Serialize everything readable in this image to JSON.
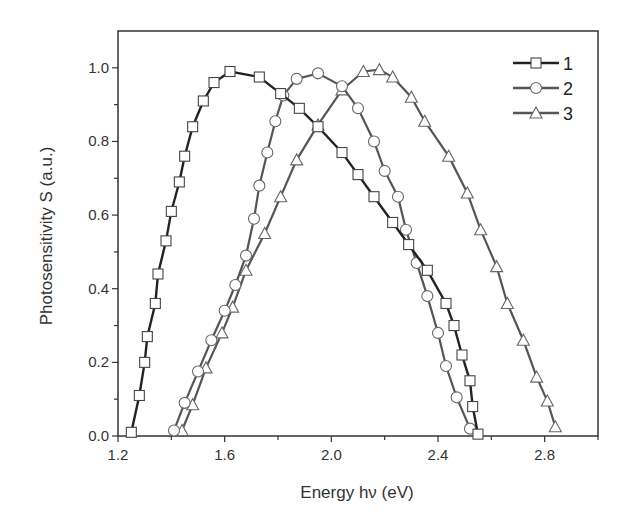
{
  "chart_data": {
    "type": "line",
    "title": "",
    "xlabel": "Energy hν (eV)",
    "ylabel": "Photosensitivity S (a.u.)",
    "xlim": [
      1.2,
      3.0
    ],
    "ylim": [
      0.0,
      1.1
    ],
    "xticks": [
      1.2,
      1.6,
      2.0,
      2.4,
      2.8
    ],
    "xtick_labels": [
      "1.2",
      "1.6",
      "2.0",
      "2.4",
      "2.8"
    ],
    "yticks": [
      0.0,
      0.2,
      0.4,
      0.6,
      0.8,
      1.0
    ],
    "ytick_labels": [
      "0.0",
      "0.2",
      "0.4",
      "0.6",
      "0.8",
      "1.0"
    ],
    "grid": false,
    "legend_position": "upper right",
    "series": [
      {
        "name": "1",
        "marker": "square",
        "color": "#222222",
        "x": [
          1.25,
          1.28,
          1.3,
          1.31,
          1.34,
          1.35,
          1.38,
          1.4,
          1.43,
          1.45,
          1.48,
          1.52,
          1.56,
          1.62,
          1.73,
          1.81,
          1.88,
          1.95,
          2.04,
          2.1,
          2.16,
          2.23,
          2.29,
          2.36,
          2.43,
          2.46,
          2.49,
          2.52,
          2.53,
          2.55
        ],
        "values": [
          0.01,
          0.11,
          0.2,
          0.27,
          0.36,
          0.44,
          0.53,
          0.61,
          0.69,
          0.76,
          0.84,
          0.91,
          0.96,
          0.99,
          0.975,
          0.93,
          0.89,
          0.84,
          0.77,
          0.71,
          0.65,
          0.58,
          0.52,
          0.45,
          0.36,
          0.3,
          0.22,
          0.15,
          0.08,
          0.005
        ]
      },
      {
        "name": "2",
        "marker": "circle",
        "color": "#555555",
        "x": [
          1.41,
          1.45,
          1.5,
          1.55,
          1.6,
          1.64,
          1.68,
          1.71,
          1.73,
          1.76,
          1.79,
          1.82,
          1.87,
          1.95,
          2.04,
          2.1,
          2.16,
          2.2,
          2.25,
          2.28,
          2.32,
          2.36,
          2.4,
          2.43,
          2.47,
          2.52
        ],
        "values": [
          0.015,
          0.09,
          0.175,
          0.26,
          0.34,
          0.41,
          0.49,
          0.59,
          0.68,
          0.77,
          0.855,
          0.925,
          0.97,
          0.985,
          0.95,
          0.89,
          0.8,
          0.72,
          0.65,
          0.56,
          0.47,
          0.38,
          0.28,
          0.19,
          0.105,
          0.02
        ]
      },
      {
        "name": "3",
        "marker": "triangle",
        "color": "#555555",
        "x": [
          1.44,
          1.48,
          1.53,
          1.59,
          1.63,
          1.68,
          1.75,
          1.81,
          1.87,
          1.95,
          2.04,
          2.12,
          2.18,
          2.23,
          2.3,
          2.35,
          2.44,
          2.51,
          2.56,
          2.62,
          2.66,
          2.72,
          2.77,
          2.81,
          2.84
        ],
        "values": [
          0.015,
          0.085,
          0.185,
          0.28,
          0.35,
          0.45,
          0.55,
          0.65,
          0.75,
          0.845,
          0.94,
          0.99,
          0.995,
          0.975,
          0.92,
          0.855,
          0.76,
          0.66,
          0.56,
          0.46,
          0.36,
          0.26,
          0.16,
          0.095,
          0.025
        ]
      }
    ]
  },
  "legend": {
    "items": [
      {
        "label": "1"
      },
      {
        "label": "2"
      },
      {
        "label": "3"
      }
    ]
  }
}
